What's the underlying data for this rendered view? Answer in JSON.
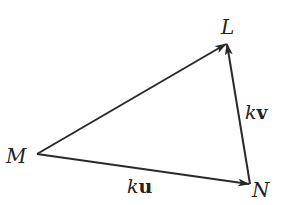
{
  "diagram": {
    "type": "vector-triangle",
    "stroke_color": "#2a2a2a",
    "background": "#ffffff",
    "vertices": {
      "M": {
        "label": "M",
        "x": 37,
        "y": 154
      },
      "L": {
        "label": "L",
        "x": 227,
        "y": 43
      },
      "N": {
        "label": "N",
        "x": 250,
        "y": 184
      }
    },
    "edges": [
      {
        "from": "M",
        "to": "L",
        "label": ""
      },
      {
        "from": "M",
        "to": "N",
        "label_scalar": "k",
        "label_vector": "u"
      },
      {
        "from": "N",
        "to": "L",
        "label_scalar": "k",
        "label_vector": "v"
      }
    ],
    "labels": {
      "M": "M",
      "L": "L",
      "N": "N",
      "ku_scalar": "k",
      "ku_vector": "u",
      "kv_scalar": "k",
      "kv_vector": "v"
    }
  }
}
